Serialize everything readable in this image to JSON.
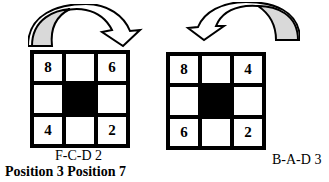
{
  "panels": [
    {
      "id": "left",
      "arrow_direction": "clockwise-right",
      "cells": [
        "8",
        "",
        "6",
        "",
        "",
        "",
        "4",
        "",
        "2"
      ],
      "dark_cell": 4,
      "label": "F-C-D 2"
    },
    {
      "id": "right",
      "arrow_direction": "counterclockwise-left",
      "cells": [
        "8",
        "",
        "4",
        "",
        "",
        "",
        "6",
        "",
        "2"
      ],
      "dark_cell": 4,
      "label": "B-A-D 3"
    }
  ],
  "caption": "Position 3 Position 7",
  "colors": {
    "arrow_fill": "#d9d9d9",
    "grid": "#000000",
    "background": "#ffffff"
  }
}
